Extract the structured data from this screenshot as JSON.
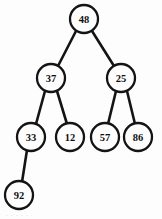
{
  "diagram": {
    "type": "binary-tree",
    "background_color": "#fdfdfd",
    "stroke_color": "#141414",
    "node_radius": 14,
    "nodes": [
      {
        "id": "n48",
        "value": "48",
        "cx": 84,
        "cy": 19,
        "level": 0
      },
      {
        "id": "n37",
        "value": "37",
        "cx": 51,
        "cy": 78,
        "level": 1
      },
      {
        "id": "n25",
        "value": "25",
        "cx": 121,
        "cy": 78,
        "level": 1
      },
      {
        "id": "n33",
        "value": "33",
        "cx": 31,
        "cy": 137,
        "level": 2
      },
      {
        "id": "n12",
        "value": "12",
        "cx": 70,
        "cy": 137,
        "level": 2
      },
      {
        "id": "n57",
        "value": "57",
        "cx": 105,
        "cy": 137,
        "level": 2
      },
      {
        "id": "n86",
        "value": "86",
        "cx": 138,
        "cy": 137,
        "level": 2
      },
      {
        "id": "n92",
        "value": "92",
        "cx": 19,
        "cy": 195,
        "level": 3
      }
    ],
    "edges": [
      {
        "from": "n48",
        "to": "n37",
        "x1": 76,
        "y1": 31,
        "x2": 58,
        "y2": 66
      },
      {
        "from": "n48",
        "to": "n25",
        "x1": 92,
        "y1": 31,
        "x2": 114,
        "y2": 66
      },
      {
        "from": "n37",
        "to": "n33",
        "x1": 45,
        "y1": 91,
        "x2": 36,
        "y2": 124
      },
      {
        "from": "n37",
        "to": "n12",
        "x1": 57,
        "y1": 91,
        "x2": 67,
        "y2": 124
      },
      {
        "from": "n25",
        "to": "n57",
        "x1": 116,
        "y1": 91,
        "x2": 108,
        "y2": 124
      },
      {
        "from": "n25",
        "to": "n86",
        "x1": 127,
        "y1": 91,
        "x2": 135,
        "y2": 124
      },
      {
        "from": "n33",
        "to": "n92",
        "x1": 27,
        "y1": 150,
        "x2": 22,
        "y2": 182
      }
    ],
    "footer_artifact": ". . .    . . ."
  }
}
